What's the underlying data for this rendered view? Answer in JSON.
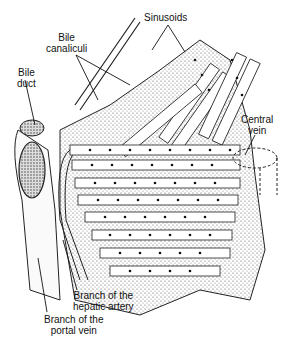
{
  "figure": {
    "labels": {
      "sinusoids": "Sinusoids",
      "bile_canaliculi_1": "Bile",
      "bile_canaliculi_2": "canaliculi",
      "bile_duct_1": "Bile",
      "bile_duct_2": "duct",
      "central_vein_1": "Central",
      "central_vein_2": "vein",
      "hepatic_artery_1": "Branch of the",
      "hepatic_artery_2": "hepatic artery",
      "portal_vein_1": "Branch of the",
      "portal_vein_2": "portal vein"
    }
  }
}
